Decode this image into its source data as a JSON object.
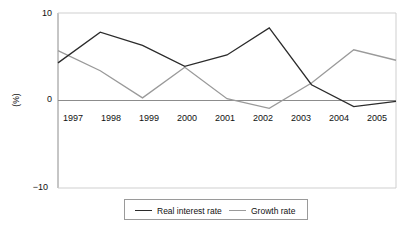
{
  "chart_data": {
    "type": "line",
    "title": "",
    "subtitle": "",
    "xlabel": "",
    "ylabel": "(%)",
    "categories": [
      "1997",
      "1998",
      "1999",
      "2000",
      "2001",
      "2002",
      "2003",
      "2004",
      "2005"
    ],
    "x": [
      1997,
      1998,
      1999,
      2000,
      2001,
      2002,
      2003,
      2004,
      2005
    ],
    "series": [
      {
        "name": "Real interest rate",
        "color": "#2b2b2b",
        "values": [
          4.3,
          7.8,
          6.3,
          3.9,
          5.2,
          8.3,
          1.8,
          -0.7,
          -0.1
        ]
      },
      {
        "name": "Growth rate",
        "color": "#9a9a9a",
        "values": [
          5.7,
          3.4,
          0.3,
          3.8,
          0.2,
          -0.9,
          2.0,
          5.8,
          4.6
        ]
      }
    ],
    "ylim": [
      -10,
      10
    ],
    "yticks": [
      10,
      0,
      -10
    ],
    "ytick_labels": [
      "10",
      "0",
      "−10"
    ],
    "xlim": [
      1997,
      2005
    ],
    "grid": false,
    "legend_position": "bottom-center",
    "legend_entries": [
      "Real interest rate",
      "Growth rate"
    ],
    "annotations": [],
    "axis_color": "#8c8c8c",
    "zero_line_color": "#8c8c8c",
    "plot_frame": "left-top-right-bottom-light"
  },
  "geometry": {
    "plot_left": 58,
    "plot_right": 396,
    "plot_top": 13,
    "plot_bottom": 188,
    "zero_y": 100
  }
}
